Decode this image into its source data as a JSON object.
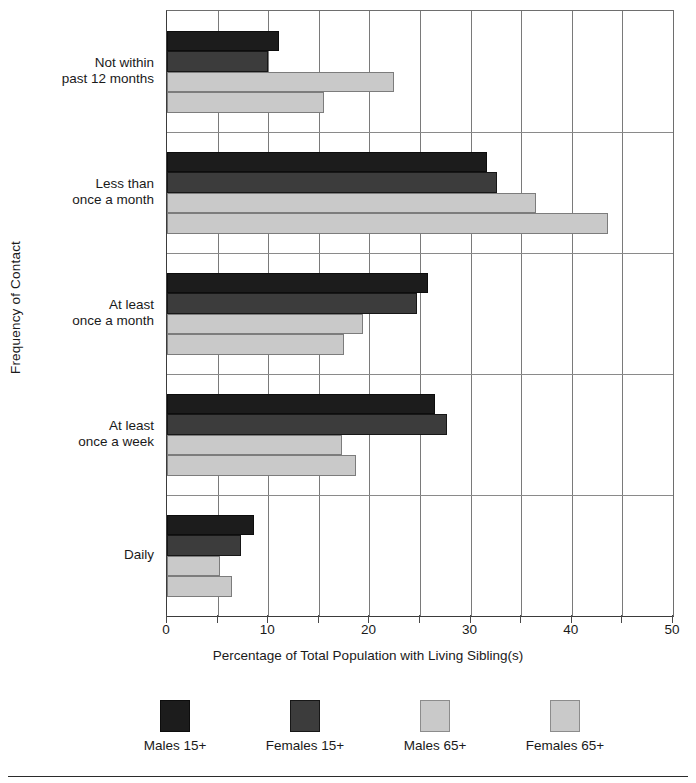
{
  "chart_data": {
    "type": "bar",
    "orientation": "horizontal",
    "title": "",
    "xlabel": "Percentage of Total Population with Living Sibling(s)",
    "ylabel": "Frequency of Contact",
    "xlim": [
      0,
      50
    ],
    "xticks": [
      0,
      5,
      10,
      15,
      20,
      25,
      30,
      35,
      40,
      45,
      50
    ],
    "xtick_labels": [
      "0",
      "",
      "10",
      "",
      "20",
      "",
      "30",
      "",
      "40",
      "",
      "50"
    ],
    "grid": "vertical-major",
    "legend_position": "bottom",
    "categories": [
      "Not within\npast 12 months",
      "Less than\nonce a month",
      "At least\nonce a month",
      "At least\nonce a week",
      "Daily"
    ],
    "series": [
      {
        "name": "Males 15+",
        "color": "#1c1c1c",
        "values": [
          11.1,
          31.6,
          25.8,
          26.5,
          8.6
        ]
      },
      {
        "name": "Females 15+",
        "color": "#3c3c3c",
        "values": [
          10.0,
          32.6,
          24.7,
          27.7,
          7.3
        ]
      },
      {
        "name": "Males 65+",
        "color": "#c9c9c9",
        "values": [
          22.4,
          36.5,
          19.4,
          17.3,
          5.2
        ]
      },
      {
        "name": "Females 65+",
        "color": "#c9c9c9",
        "values": [
          15.5,
          43.6,
          17.5,
          18.7,
          6.4
        ]
      }
    ]
  },
  "legend": {
    "items": [
      {
        "label": "Males 15+"
      },
      {
        "label": "Females 15+"
      },
      {
        "label": "Males 65+"
      },
      {
        "label": "Females 65+"
      }
    ]
  },
  "axes": {
    "x_title": "Percentage of Total Population with Living Sibling(s)",
    "y_title": "Frequency of Contact"
  }
}
